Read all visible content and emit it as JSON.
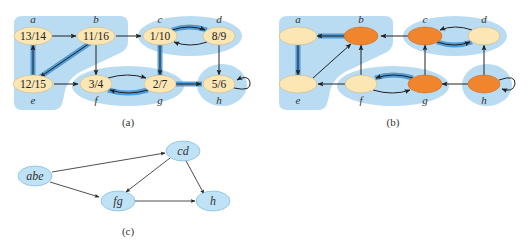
{
  "colors": {
    "region": "#b9dcf2",
    "node_plain": "#fbe6b4",
    "node_highlight": "#f0852d",
    "node_border": "#c9b88a",
    "edge": "#222222",
    "tree_edge_halo": "#3f8fcf",
    "dag_node": "#bfe2f6",
    "dag_border": "#6aaed6"
  },
  "panel_a": {
    "caption": "(a)",
    "nodes": [
      {
        "id": "a",
        "label": "a",
        "times": "13/14"
      },
      {
        "id": "b",
        "label": "b",
        "times": "11/16"
      },
      {
        "id": "c",
        "label": "c",
        "times": "1/10"
      },
      {
        "id": "d",
        "label": "d",
        "times": "8/9"
      },
      {
        "id": "e",
        "label": "e",
        "times": "12/15"
      },
      {
        "id": "f",
        "label": "f",
        "times": "3/4"
      },
      {
        "id": "g",
        "label": "g",
        "times": "2/7"
      },
      {
        "id": "h",
        "label": "h",
        "times": "5/6"
      }
    ],
    "edges": [
      {
        "from": "a",
        "to": "b",
        "tree": false
      },
      {
        "from": "b",
        "to": "c",
        "tree": false
      },
      {
        "from": "b",
        "to": "e",
        "tree": true
      },
      {
        "from": "b",
        "to": "f",
        "tree": false
      },
      {
        "from": "c",
        "to": "d",
        "tree": true
      },
      {
        "from": "d",
        "to": "c",
        "tree": false
      },
      {
        "from": "c",
        "to": "g",
        "tree": true
      },
      {
        "from": "d",
        "to": "h",
        "tree": false
      },
      {
        "from": "e",
        "to": "a",
        "tree": true
      },
      {
        "from": "e",
        "to": "f",
        "tree": false
      },
      {
        "from": "f",
        "to": "g",
        "tree": false
      },
      {
        "from": "g",
        "to": "f",
        "tree": true
      },
      {
        "from": "g",
        "to": "h",
        "tree": true
      },
      {
        "from": "h",
        "to": "h",
        "tree": false
      }
    ]
  },
  "panel_b": {
    "caption": "(b)",
    "nodes": [
      {
        "id": "a",
        "label": "a",
        "highlighted": false
      },
      {
        "id": "b",
        "label": "b",
        "highlighted": true
      },
      {
        "id": "c",
        "label": "c",
        "highlighted": true
      },
      {
        "id": "d",
        "label": "d",
        "highlighted": false
      },
      {
        "id": "e",
        "label": "e",
        "highlighted": false
      },
      {
        "id": "f",
        "label": "f",
        "highlighted": false
      },
      {
        "id": "g",
        "label": "g",
        "highlighted": true
      },
      {
        "id": "h",
        "label": "h",
        "highlighted": true
      }
    ],
    "edges": [
      {
        "from": "b",
        "to": "a",
        "tree": true
      },
      {
        "from": "c",
        "to": "b",
        "tree": false
      },
      {
        "from": "e",
        "to": "b",
        "tree": false
      },
      {
        "from": "f",
        "to": "b",
        "tree": false
      },
      {
        "from": "c",
        "to": "d",
        "tree": true
      },
      {
        "from": "d",
        "to": "c",
        "tree": false
      },
      {
        "from": "g",
        "to": "c",
        "tree": false
      },
      {
        "from": "h",
        "to": "d",
        "tree": false
      },
      {
        "from": "a",
        "to": "e",
        "tree": true
      },
      {
        "from": "f",
        "to": "e",
        "tree": false
      },
      {
        "from": "g",
        "to": "f",
        "tree": true
      },
      {
        "from": "f",
        "to": "g",
        "tree": false
      },
      {
        "from": "h",
        "to": "g",
        "tree": false
      },
      {
        "from": "h",
        "to": "h",
        "tree": false
      }
    ]
  },
  "panel_c": {
    "caption": "(c)",
    "nodes": [
      {
        "id": "abe",
        "label": "abe"
      },
      {
        "id": "cd",
        "label": "cd"
      },
      {
        "id": "fg",
        "label": "fg"
      },
      {
        "id": "h",
        "label": "h"
      }
    ],
    "edges": [
      {
        "from": "abe",
        "to": "cd"
      },
      {
        "from": "abe",
        "to": "fg"
      },
      {
        "from": "cd",
        "to": "fg"
      },
      {
        "from": "cd",
        "to": "h"
      },
      {
        "from": "fg",
        "to": "h"
      }
    ]
  }
}
